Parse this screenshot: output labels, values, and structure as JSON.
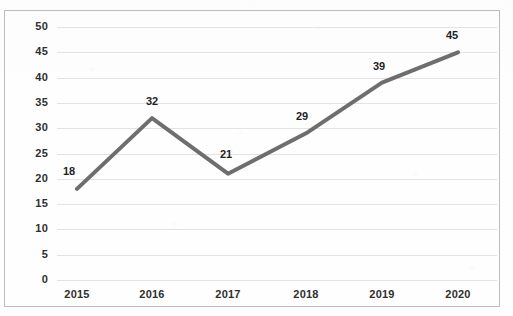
{
  "chart_data": {
    "type": "line",
    "title": "",
    "subtitle": "",
    "xlabel": "",
    "ylabel": "",
    "categories": [
      "2015",
      "2016",
      "2017",
      "2018",
      "2019",
      "2020"
    ],
    "values": [
      18,
      32,
      21,
      29,
      39,
      45
    ],
    "data_labels": [
      "18",
      "32",
      "21",
      "29",
      "39",
      "45"
    ],
    "ylim": [
      0,
      50
    ],
    "ytick_step": 5,
    "yticks": [
      "0",
      "5",
      "10",
      "15",
      "20",
      "25",
      "30",
      "35",
      "40",
      "45",
      "50"
    ],
    "grid": "horizontal",
    "legend": "none",
    "series": [
      {
        "name": "",
        "values": [
          18,
          32,
          21,
          29,
          39,
          45
        ],
        "line_color": "#6e6e6e",
        "line_width": 4,
        "markers": "none"
      }
    ],
    "colors": {
      "line": "#6e6e6e",
      "gridline": "#e3e3e3",
      "border": "#bdbdbd",
      "label_text": "#2f2f2f",
      "background": "#fefefe"
    }
  }
}
